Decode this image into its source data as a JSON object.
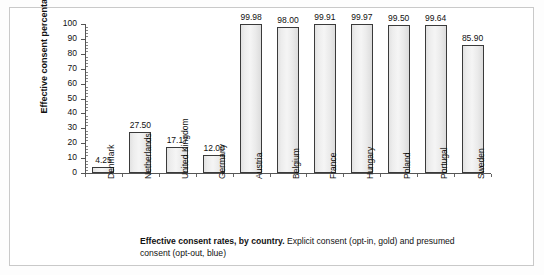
{
  "chart_data": {
    "type": "bar",
    "title": "",
    "xlabel": "",
    "ylabel": "Effective consent percentage",
    "ylim": [
      0,
      100
    ],
    "ytick_step": 10,
    "yticks": [
      0,
      10,
      20,
      30,
      40,
      50,
      60,
      70,
      80,
      90,
      100
    ],
    "grid": false,
    "legend_position": "none",
    "categories": [
      "Denmark",
      "Netherlands",
      "United Kingdom",
      "Germany",
      "Austria",
      "Belgium",
      "France",
      "Hungary",
      "Poland",
      "Portugal",
      "Sweden"
    ],
    "values": [
      4.25,
      27.5,
      17.17,
      12.0,
      99.98,
      98.0,
      99.91,
      99.97,
      99.5,
      99.64,
      85.9
    ],
    "value_labels": [
      "4.25",
      "27.50",
      "17.17",
      "12.00",
      "99.98",
      "98.00",
      "99.91",
      "99.97",
      "99.50",
      "99.64",
      "85.90"
    ],
    "consent_type": [
      "opt-in",
      "opt-in",
      "opt-in",
      "opt-in",
      "opt-out",
      "opt-out",
      "opt-out",
      "opt-out",
      "opt-out",
      "opt-out",
      "opt-out"
    ],
    "bar_fill_color": "#eeeeee",
    "bar_border_color": "#3a3a3a"
  },
  "caption": {
    "bold_lead": "Effective consent rates, by country.",
    "rest": " Explicit consent (opt-in, gold) and presumed consent (opt-out, blue)"
  }
}
